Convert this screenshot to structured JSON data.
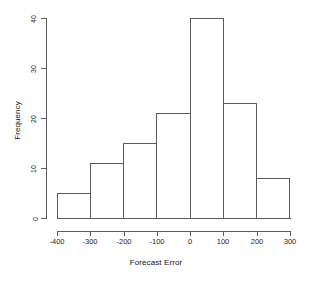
{
  "chart_data": {
    "type": "bar",
    "title": "",
    "subtitle": "",
    "xlabel": "Forecast Error",
    "ylabel": "Frequency",
    "categories": [
      "-400 to -300",
      "-300 to -200",
      "-200 to -100",
      "-100 to 0",
      "0 to 100",
      "100 to 200",
      "200 to 300"
    ],
    "bin_edges": [
      -400,
      -300,
      -200,
      -100,
      0,
      100,
      200,
      300
    ],
    "bin_width": 100,
    "values": [
      5,
      11,
      15,
      21,
      40,
      23,
      8
    ],
    "bars": [
      {
        "bin_start": -400,
        "bin_end": -300,
        "frequency": 5
      },
      {
        "bin_start": -300,
        "bin_end": -200,
        "frequency": 11
      },
      {
        "bin_start": -200,
        "bin_end": -100,
        "frequency": 15
      },
      {
        "bin_start": -100,
        "bin_end": 0,
        "frequency": 21
      },
      {
        "bin_start": 0,
        "bin_end": 100,
        "frequency": 40
      },
      {
        "bin_start": 100,
        "bin_end": 200,
        "frequency": 23
      },
      {
        "bin_start": 200,
        "bin_end": 300,
        "frequency": 8
      }
    ],
    "xlim": [
      -400,
      300
    ],
    "ylim": [
      0,
      40
    ],
    "xticks": [
      -400,
      -300,
      -200,
      -100,
      0,
      100,
      200,
      300
    ],
    "xtick_labels": [
      "-400",
      "-300",
      "-200",
      "-100",
      "0",
      "100",
      "200",
      "300"
    ],
    "yticks": [
      0,
      10,
      20,
      30,
      40
    ],
    "ytick_labels": [
      "0",
      "10",
      "20",
      "30",
      "40"
    ],
    "grid": false,
    "legend": false,
    "legend_position": "none",
    "bar_fill_color": "#ffffff",
    "bar_border_color": "#5c5c5c",
    "axis_color": "#5c5c5c",
    "text_color": "#1a1a1a",
    "background_color": "#ffffff",
    "total_count": 123
  }
}
